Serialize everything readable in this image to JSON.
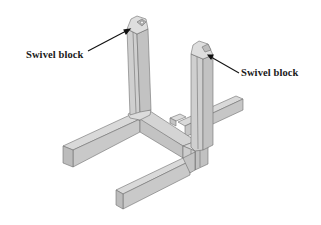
{
  "diagram": {
    "labels": [
      {
        "text": "Swivel block",
        "target": "left-post-swivel-block"
      },
      {
        "text": "Swivel block",
        "target": "right-post-swivel-block"
      }
    ],
    "colors": {
      "face_light": "#d6d6d6",
      "face_mid": "#c8c8c8",
      "face_dark": "#b9b9b9",
      "edge": "#6e6e6e",
      "leader": "#111111",
      "text": "#1a1a1a",
      "background": "#ffffff"
    }
  }
}
